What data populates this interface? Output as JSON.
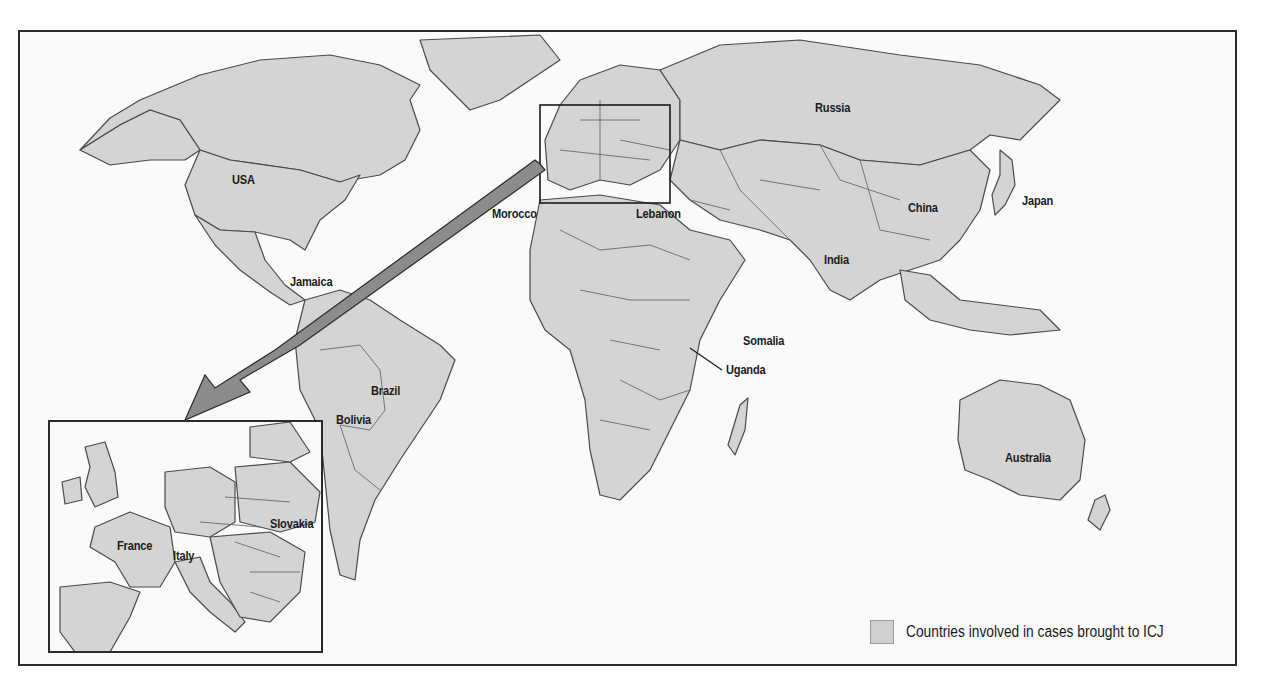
{
  "map": {
    "title": "Countries involved in cases brought to ICJ",
    "fill_color": "#d4d4d4",
    "background_color": "#fafafa",
    "labels": [
      {
        "name": "USA",
        "x": 232,
        "y": 180
      },
      {
        "name": "Jamaica",
        "x": 290,
        "y": 282
      },
      {
        "name": "Morocco",
        "x": 492,
        "y": 206
      },
      {
        "name": "Lebanon",
        "x": 636,
        "y": 206
      },
      {
        "name": "Russia",
        "x": 815,
        "y": 102
      },
      {
        "name": "China",
        "x": 908,
        "y": 202
      },
      {
        "name": "Japan",
        "x": 1022,
        "y": 193
      },
      {
        "name": "India",
        "x": 824,
        "y": 254
      },
      {
        "name": "Somalia",
        "x": 743,
        "y": 333
      },
      {
        "name": "Uganda",
        "x": 726,
        "y": 362
      },
      {
        "name": "Brazil",
        "x": 371,
        "y": 383
      },
      {
        "name": "Bolivia",
        "x": 336,
        "y": 414
      },
      {
        "name": "Australia",
        "x": 1005,
        "y": 450
      }
    ],
    "inset": {
      "region": "Europe",
      "labels": [
        {
          "name": "France",
          "x": 117,
          "y": 546
        },
        {
          "name": "Italy",
          "x": 173,
          "y": 556
        },
        {
          "name": "Slovakia",
          "x": 270,
          "y": 520
        }
      ]
    }
  },
  "legend": {
    "swatch_color": "#cfcfcf",
    "label": "Countries involved in cases brought to ICJ"
  }
}
